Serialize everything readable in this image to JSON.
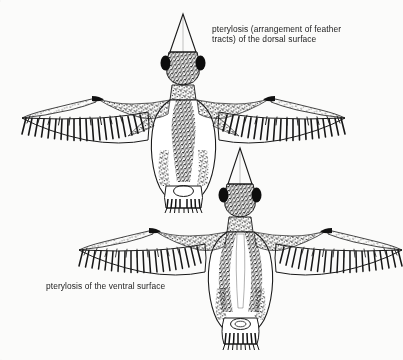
{
  "figure": {
    "background_color": "#fbfbfa",
    "ink_color": "#1a1a1a",
    "medium": "stippled pen-and-ink scientific illustration"
  },
  "captions": {
    "dorsal": "pterylosis (arrangement of feather\ntracts) of the dorsal surface",
    "ventral": "pterylosis of the ventral surface"
  },
  "specimens": [
    {
      "name": "dorsal-bird",
      "view": "dorsal",
      "label_ref": "captions.dorsal",
      "parts": [
        "beak",
        "crown",
        "eye-patch-left",
        "eye-patch-right",
        "nape",
        "mantle",
        "back-tract",
        "wing-left",
        "wing-right",
        "flank-left",
        "flank-right",
        "tail-fan"
      ]
    },
    {
      "name": "ventral-bird",
      "view": "ventral",
      "label_ref": "captions.ventral",
      "parts": [
        "beak",
        "throat",
        "eye-patch-left",
        "eye-patch-right",
        "breast-tract-left",
        "breast-tract-right",
        "wing-left",
        "wing-right",
        "belly-left",
        "belly-right",
        "vent",
        "tail-fan"
      ]
    }
  ]
}
